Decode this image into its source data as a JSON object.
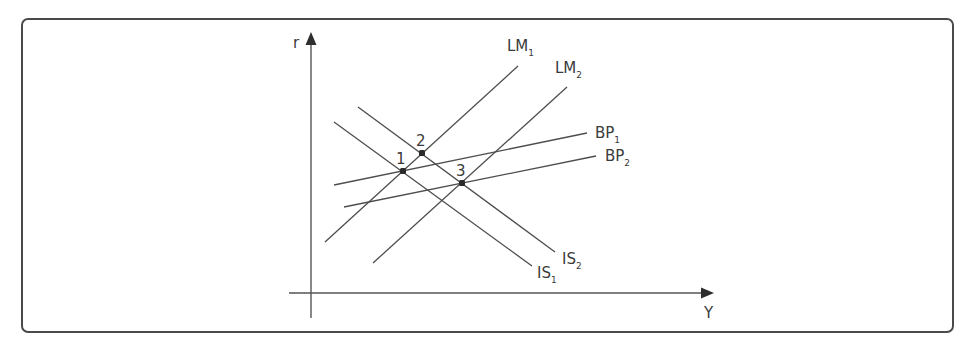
{
  "diagram": {
    "type": "IS-LM-BP macroeconomic diagram",
    "axes": {
      "y_label": "r",
      "x_label": "Y"
    },
    "curves": [
      {
        "id": "LM1",
        "base": "LM",
        "sub": "1",
        "x1": 325,
        "y1": 242,
        "x2": 518,
        "y2": 66,
        "label_x": 507,
        "label_y": 51
      },
      {
        "id": "LM2",
        "base": "LM",
        "sub": "2",
        "x1": 373,
        "y1": 263,
        "x2": 567,
        "y2": 87,
        "label_x": 555,
        "label_y": 73
      },
      {
        "id": "BP1",
        "base": "BP",
        "sub": "1",
        "x1": 334,
        "y1": 185,
        "x2": 587,
        "y2": 133,
        "label_x": 595,
        "label_y": 138
      },
      {
        "id": "BP2",
        "base": "BP",
        "sub": "2",
        "x1": 344,
        "y1": 207,
        "x2": 596,
        "y2": 156,
        "label_x": 605,
        "label_y": 161
      },
      {
        "id": "IS1",
        "base": "IS",
        "sub": "1",
        "x1": 334,
        "y1": 122,
        "x2": 532,
        "y2": 266,
        "label_x": 537,
        "label_y": 278
      },
      {
        "id": "IS2",
        "base": "IS",
        "sub": "2",
        "x1": 358,
        "y1": 107,
        "x2": 555,
        "y2": 252,
        "label_x": 562,
        "label_y": 264
      }
    ],
    "points": [
      {
        "label": "1",
        "x": 403,
        "y": 171,
        "label_x": 396,
        "label_y": 164
      },
      {
        "label": "2",
        "x": 422,
        "y": 153,
        "label_x": 416,
        "label_y": 146
      },
      {
        "label": "3",
        "x": 462,
        "y": 183,
        "label_x": 456,
        "label_y": 176
      }
    ]
  }
}
